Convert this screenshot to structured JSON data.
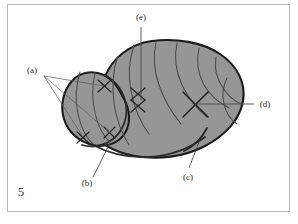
{
  "figure": {
    "number": "5",
    "fill_color": "#969696",
    "outline_color": "#1c1c1c",
    "frame_color": "#b9b9b9",
    "background_color": "#ffffff",
    "labels": {
      "a": "(a)",
      "b": "(b)",
      "c": "(c)",
      "d": "(d)",
      "e": "(e)"
    },
    "annotations": [
      {
        "key": "a",
        "text": "(a)",
        "position": "upper-left-outside",
        "leader_count": 3,
        "points_to": "three small x-markers on left lobe"
      },
      {
        "key": "b",
        "text": "(b)",
        "position": "bottom-left-outside",
        "leader_count": 1,
        "points_to": "lower boundary of left lobe"
      },
      {
        "key": "c",
        "text": "(c)",
        "position": "bottom-center-outside",
        "leader_count": 1,
        "points_to": "thick dark contour along lower right margin"
      },
      {
        "key": "d",
        "text": "(d)",
        "position": "right-outside",
        "leader_count": 1,
        "points_to": "large x-marker in right region"
      },
      {
        "key": "e",
        "text": "(e)",
        "position": "top-center-outside",
        "leader_count": 1,
        "points_to": "stacked double x-marker in central region"
      }
    ],
    "markers": [
      {
        "name": "x-marker-a1",
        "cx": 104,
        "cy": 86,
        "size": 7
      },
      {
        "name": "x-marker-a2",
        "cx": 83,
        "cy": 137,
        "size": 6
      },
      {
        "name": "x-marker-a3",
        "cx": 109,
        "cy": 132,
        "size": 6
      },
      {
        "name": "x-marker-e",
        "cx": 138,
        "cy": 98,
        "size": 8
      },
      {
        "name": "x-marker-d",
        "cx": 195,
        "cy": 104,
        "size": 12
      }
    ]
  }
}
